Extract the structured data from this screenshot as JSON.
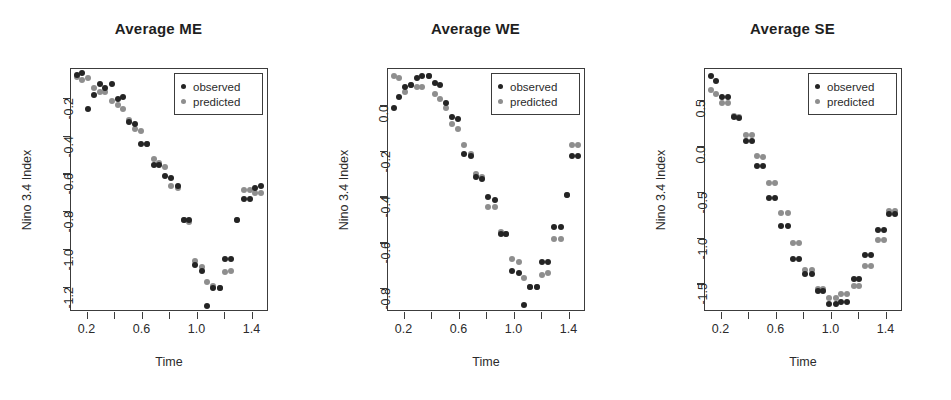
{
  "figure": {
    "width": 951,
    "height": 400,
    "background": "#ffffff",
    "observed_color": "#242424",
    "predicted_color": "#8e8e8e",
    "axis_color": "#3c3c3c"
  },
  "legend": {
    "observed_label": "observed",
    "predicted_label": "predicted"
  },
  "chart_data": [
    {
      "type": "scatter",
      "title": "Average ME",
      "xlabel": "Time",
      "ylabel": "Nino 3.4 Index",
      "xlim": [
        0.08,
        1.52
      ],
      "ylim": [
        -1.33,
        -0.04
      ],
      "xticks": [
        0.2,
        0.4,
        0.6,
        0.8,
        1.0,
        1.2,
        1.4
      ],
      "xticklabels": [
        "0.2",
        "",
        "0.6",
        "",
        "1.0",
        "",
        "1.4"
      ],
      "yticks": [
        -0.2,
        -0.4,
        -0.6,
        -0.8,
        -1.0,
        -1.2
      ],
      "yticklabels": [
        "-0.2",
        "-0.4",
        "-0.6",
        "-0.8",
        "-1.0",
        "-1.2"
      ],
      "grid": false,
      "legend_position": "top-right",
      "x": [
        0.12,
        0.16,
        0.2,
        0.245,
        0.29,
        0.33,
        0.375,
        0.42,
        0.46,
        0.5,
        0.545,
        0.59,
        0.635,
        0.68,
        0.72,
        0.765,
        0.81,
        0.855,
        0.9,
        0.94,
        0.985,
        1.03,
        1.07,
        1.115,
        1.16,
        1.2,
        1.245,
        1.29,
        1.335,
        1.38,
        1.42,
        1.465
      ],
      "series": [
        {
          "name": "observed",
          "values": [
            -0.07,
            -0.06,
            -0.25,
            -0.18,
            -0.12,
            -0.14,
            -0.12,
            -0.2,
            -0.19,
            -0.32,
            -0.33,
            -0.44,
            -0.44,
            -0.55,
            -0.55,
            -0.61,
            -0.62,
            -0.66,
            -0.84,
            -0.84,
            -1.08,
            -1.11,
            -1.3,
            -1.2,
            -1.2,
            -1.05,
            -1.05,
            -0.84,
            -0.73,
            -0.73,
            -0.67,
            -0.66
          ]
        },
        {
          "name": "predicted",
          "values": [
            -0.08,
            -0.1,
            -0.09,
            -0.14,
            -0.16,
            -0.16,
            -0.21,
            -0.23,
            -0.25,
            -0.31,
            -0.36,
            -0.37,
            -0.44,
            -0.52,
            -0.54,
            -0.56,
            -0.66,
            -0.67,
            -0.84,
            -0.85,
            -1.06,
            -1.09,
            -1.17,
            -1.19,
            -1.2,
            -1.12,
            -1.11,
            -0.84,
            -0.68,
            -0.68,
            -0.7,
            -0.7
          ]
        }
      ]
    },
    {
      "type": "scatter",
      "title": "Average WE",
      "xlabel": "Time",
      "ylabel": "Nino 3.4 Index",
      "xlim": [
        0.08,
        1.52
      ],
      "ylim": [
        -0.9,
        0.16
      ],
      "xticks": [
        0.2,
        0.4,
        0.6,
        0.8,
        1.0,
        1.2,
        1.4
      ],
      "xticklabels": [
        "0.2",
        "",
        "0.6",
        "",
        "1.0",
        "",
        "1.4"
      ],
      "yticks": [
        0.0,
        -0.2,
        -0.4,
        -0.6,
        -0.8
      ],
      "yticklabels": [
        "0.0",
        "-0.2",
        "-0.4",
        "-0.6",
        "-0.8"
      ],
      "grid": false,
      "legend_position": "top-right",
      "x": [
        0.12,
        0.16,
        0.2,
        0.245,
        0.29,
        0.33,
        0.375,
        0.42,
        0.46,
        0.5,
        0.545,
        0.59,
        0.635,
        0.68,
        0.72,
        0.765,
        0.81,
        0.855,
        0.9,
        0.94,
        0.985,
        1.03,
        1.07,
        1.115,
        1.16,
        1.2,
        1.245,
        1.29,
        1.335,
        1.38,
        1.42,
        1.465
      ],
      "series": [
        {
          "name": "observed",
          "values": [
            -0.01,
            0.04,
            0.08,
            0.09,
            0.12,
            0.13,
            0.13,
            0.1,
            0.09,
            0.01,
            -0.05,
            -0.06,
            -0.21,
            -0.22,
            -0.31,
            -0.32,
            -0.4,
            -0.41,
            -0.56,
            -0.56,
            -0.72,
            -0.73,
            -0.87,
            -0.79,
            -0.79,
            -0.68,
            -0.68,
            -0.53,
            -0.53,
            -0.39,
            -0.22,
            -0.22
          ]
        },
        {
          "name": "predicted",
          "values": [
            0.13,
            0.12,
            0.06,
            0.09,
            0.08,
            0.08,
            0.13,
            0.05,
            0.03,
            -0.01,
            -0.08,
            -0.1,
            -0.17,
            -0.21,
            -0.3,
            -0.31,
            -0.44,
            -0.44,
            -0.55,
            -0.56,
            -0.67,
            -0.68,
            -0.75,
            -0.79,
            -0.79,
            -0.74,
            -0.73,
            -0.58,
            -0.58,
            -0.39,
            -0.17,
            -0.17
          ]
        }
      ]
    },
    {
      "type": "scatter",
      "title": "Average SE",
      "xlabel": "Time",
      "ylabel": "Nino 3.4 Index",
      "xlim": [
        0.08,
        1.52
      ],
      "ylim": [
        -1.8,
        0.85
      ],
      "xticks": [
        0.2,
        0.4,
        0.6,
        0.8,
        1.0,
        1.2,
        1.4
      ],
      "xticklabels": [
        "0.2",
        "",
        "0.6",
        "",
        "1.0",
        "",
        "1.4"
      ],
      "yticks": [
        0.5,
        0.0,
        -0.5,
        -1.0,
        -1.5
      ],
      "yticklabels": [
        "0.5",
        "0.0",
        "-0.5",
        "-1.0",
        "-1.5"
      ],
      "grid": false,
      "legend_position": "top-right",
      "x": [
        0.12,
        0.16,
        0.2,
        0.245,
        0.29,
        0.33,
        0.375,
        0.42,
        0.46,
        0.5,
        0.545,
        0.59,
        0.635,
        0.68,
        0.72,
        0.765,
        0.81,
        0.855,
        0.9,
        0.94,
        0.985,
        1.03,
        1.07,
        1.115,
        1.16,
        1.2,
        1.245,
        1.29,
        1.335,
        1.38,
        1.42,
        1.465
      ],
      "series": [
        {
          "name": "observed",
          "values": [
            0.77,
            0.72,
            0.55,
            0.54,
            0.33,
            0.32,
            0.07,
            0.06,
            -0.21,
            -0.21,
            -0.56,
            -0.56,
            -0.86,
            -0.86,
            -1.22,
            -1.22,
            -1.39,
            -1.39,
            -1.57,
            -1.57,
            -1.71,
            -1.71,
            -1.69,
            -1.69,
            -1.44,
            -1.44,
            -1.18,
            -1.18,
            -0.91,
            -0.91,
            -0.73,
            -0.73
          ]
        },
        {
          "name": "predicted",
          "values": [
            0.62,
            0.58,
            0.48,
            0.48,
            0.34,
            0.33,
            0.13,
            0.13,
            -0.1,
            -0.11,
            -0.39,
            -0.39,
            -0.72,
            -0.72,
            -1.05,
            -1.05,
            -1.34,
            -1.34,
            -1.55,
            -1.55,
            -1.65,
            -1.65,
            -1.6,
            -1.6,
            -1.52,
            -1.52,
            -1.3,
            -1.3,
            -1.02,
            -1.02,
            -0.7,
            -0.7
          ]
        }
      ]
    }
  ]
}
